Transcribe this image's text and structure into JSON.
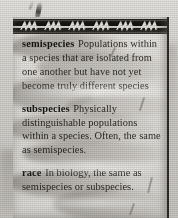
{
  "page": {
    "kind": "scanned-glossary-page",
    "header_band": {
      "motif": "zigzag-wave-ornament",
      "motif_repeat_count": 6,
      "color": "#161513",
      "motif_color": "#e8e6e2"
    },
    "paper_color": "#e2e0dc",
    "ink_color": "#2b2926",
    "entries": [
      {
        "headword": "semispecies",
        "definition": "Populations within a species that are isolated from one another but have not yet become truly different species"
      },
      {
        "headword": "subspecies",
        "definition": "Physically distinguishable populations within a species. Often, the same as semispecies."
      },
      {
        "headword": "race",
        "definition": "In biology, the same as semispecies or subspecies."
      }
    ]
  },
  "marks": {
    "ink_flick_label": "ink-brush-mark"
  }
}
